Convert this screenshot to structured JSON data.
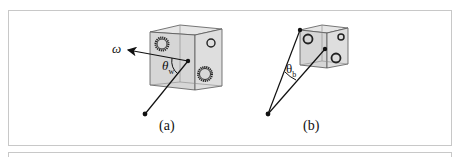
{
  "figure": {
    "panels": [
      {
        "id": "a",
        "caption": "(a)",
        "vector_label": "ω",
        "angle_label_main": "θ",
        "angle_label_sub": "w",
        "description": "cube with textured spheres, vector from point to cube center, angle theta_w to omega direction"
      },
      {
        "id": "b",
        "caption": "(b)",
        "angle_label_main": "θ",
        "angle_label_sub": "b",
        "description": "smaller cube, two lines from point to cube corner and cube center forming angle theta_b"
      }
    ],
    "colors": {
      "frame_border": "#c8c8c8",
      "cube_face": "#d9d9d9",
      "cube_face_side": "#e4e4e4",
      "ink": "#111111"
    }
  }
}
